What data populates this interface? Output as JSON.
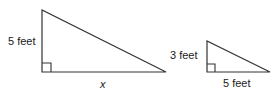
{
  "figure": {
    "background_color": "#ffffff",
    "stroke_color": "#333333"
  },
  "large_triangle": {
    "name": "large-right-triangle",
    "height_label": "5 feet",
    "base_label": "x",
    "right_angle_marker": true,
    "vertices": {
      "apex": [
        42,
        10
      ],
      "right_angle": [
        42,
        72
      ],
      "base_end": [
        166,
        72
      ]
    }
  },
  "small_triangle": {
    "name": "small-right-triangle",
    "height_label": "3 feet",
    "base_label": "5 feet",
    "right_angle_marker": true,
    "vertices": {
      "apex": [
        207,
        41
      ],
      "right_angle": [
        207,
        72
      ],
      "base_end": [
        270,
        72
      ]
    }
  }
}
